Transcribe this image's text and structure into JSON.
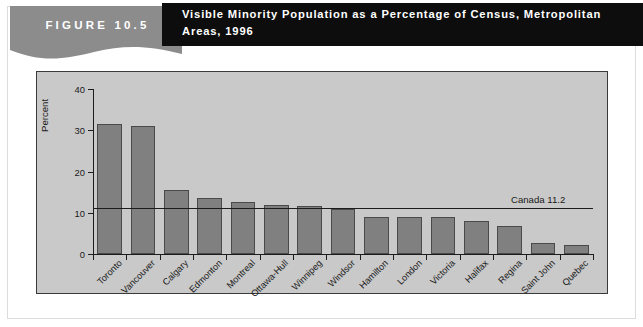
{
  "figure": {
    "badge": "FIGURE 10.5",
    "title": "Visible Minority Population as a Percentage of Census, Metropolitan Areas, 1996"
  },
  "colors": {
    "badge_band": "#8c8c8c",
    "title_band": "#0d0d0d",
    "plot_background": "#c9c9c9",
    "bar_fill": "#808080",
    "bar_stroke": "#4a4a4a",
    "axis": "#1c1c1c"
  },
  "chart_data": {
    "type": "bar",
    "title": "Visible Minority Population as a Percentage of Census, Metropolitan Areas, 1996",
    "xlabel": "",
    "ylabel": "Percent",
    "ylim": [
      0,
      40
    ],
    "yticks": [
      0,
      10,
      20,
      30,
      40
    ],
    "grid": false,
    "legend": null,
    "categories": [
      "Toronto",
      "Vancouver",
      "Calgary",
      "Edmonton",
      "Montreal",
      "Ottawa-Hull",
      "Winnipeg",
      "Windsor",
      "Hamilton",
      "London",
      "Victoria",
      "Halifax",
      "Regina",
      "Saint John",
      "Quebec"
    ],
    "values": [
      31.6,
      31.1,
      15.6,
      13.6,
      12.5,
      11.9,
      11.7,
      10.8,
      9.0,
      8.9,
      8.9,
      8.0,
      6.9,
      2.6,
      2.3
    ],
    "annotations": [
      {
        "name": "canada-average",
        "label": "Canada 11.2",
        "value": 11.2,
        "orientation": "horizontal"
      }
    ]
  }
}
